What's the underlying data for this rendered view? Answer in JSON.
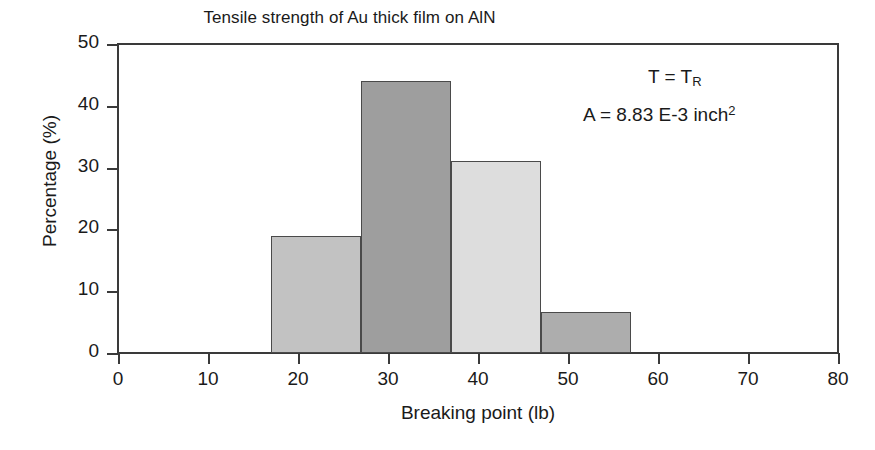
{
  "chart_data": {
    "type": "bar",
    "title": "Tensile strength of Au thick film on AlN",
    "xlabel": "Breaking point (lb)",
    "ylabel": "Percentage (%)",
    "xlim": [
      0,
      80
    ],
    "ylim": [
      0,
      50
    ],
    "xticks": [
      0,
      10,
      20,
      30,
      40,
      50,
      60,
      70,
      80
    ],
    "yticks": [
      0,
      10,
      20,
      30,
      40,
      50
    ],
    "grid": false,
    "legend": null,
    "histogram": true,
    "bin_edges": [
      17,
      27,
      37,
      47,
      57
    ],
    "categories": [
      "17-27",
      "27-37",
      "37-47",
      "47-57"
    ],
    "values": [
      19.0,
      44.0,
      31.0,
      6.7
    ],
    "bar_colors": [
      "#c2c2c2",
      "#9e9e9e",
      "#dddddd",
      "#adadad"
    ],
    "bar_edge_color": "#4a4a4a",
    "annotations": [
      {
        "id": "temperature",
        "prefix": "T = T",
        "sub": "R",
        "suffix": ""
      },
      {
        "id": "area",
        "prefix": "A = 8.83 E-3 inch",
        "sup": "2",
        "suffix": ""
      }
    ]
  }
}
